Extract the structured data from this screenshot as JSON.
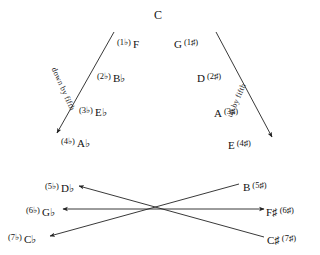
{
  "diagram": {
    "title_note": "C",
    "flat_direction_label": "down by fifth",
    "sharp_direction_label": "up by fifth",
    "flats_branch": [
      {
        "count": "(1♭)",
        "note": "F"
      },
      {
        "count": "(2♭)",
        "note": "B♭"
      },
      {
        "count": "(3♭)",
        "note": "E♭"
      },
      {
        "count": "(4♭)",
        "note": "A♭"
      },
      {
        "count": "(5♭)",
        "note": "D♭"
      },
      {
        "count": "(6♭)",
        "note": "G♭"
      },
      {
        "count": "(7♭)",
        "note": "C♭"
      }
    ],
    "sharps_branch": [
      {
        "note": "G",
        "count": "(1♯)"
      },
      {
        "note": "D",
        "count": "(2♯)"
      },
      {
        "note": "A",
        "count": "(3♯)"
      },
      {
        "note": "E",
        "count": "(4♯)"
      },
      {
        "note": "B",
        "count": "(5♯)"
      },
      {
        "note": "F♯",
        "count": "(6♯)"
      },
      {
        "note": "C♯",
        "count": "(7♯)"
      }
    ],
    "enharmonic_pairs": [
      {
        "flat": "D♭",
        "sharp": "B♯_equiv_B"
      },
      {
        "flat": "G♭",
        "sharp": "F♯"
      },
      {
        "flat": "C♭",
        "sharp": "C♯_equiv_B"
      }
    ],
    "stroke_color": "#222222",
    "text_color": "#111111"
  }
}
